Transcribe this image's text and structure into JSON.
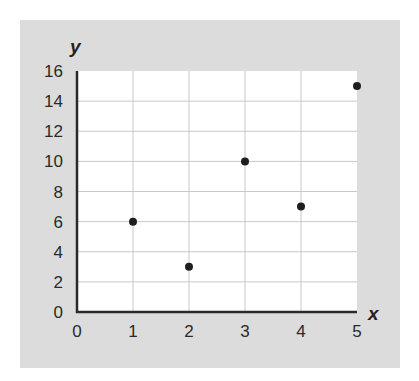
{
  "chart_data": {
    "type": "scatter",
    "title": "",
    "xlabel": "x",
    "ylabel": "y",
    "x": [
      1,
      2,
      3,
      4,
      5
    ],
    "y": [
      6,
      3,
      10,
      7,
      15
    ],
    "points": [
      {
        "x": 1,
        "y": 6
      },
      {
        "x": 2,
        "y": 3
      },
      {
        "x": 3,
        "y": 10
      },
      {
        "x": 4,
        "y": 7
      },
      {
        "x": 5,
        "y": 15
      }
    ],
    "xlim": [
      0,
      5
    ],
    "ylim": [
      0,
      16
    ],
    "x_ticks": [
      "0",
      "1",
      "2",
      "3",
      "4",
      "5"
    ],
    "y_ticks": [
      "0",
      "2",
      "4",
      "6",
      "8",
      "10",
      "12",
      "14",
      "16"
    ],
    "grid": true,
    "legend": null,
    "colors": {
      "panel_background": "#dcdcdc",
      "plot_background": "#ffffff",
      "gridline": "#c8c8c8",
      "axis": "#2a2a2a",
      "point": "#1e1e1e"
    }
  }
}
